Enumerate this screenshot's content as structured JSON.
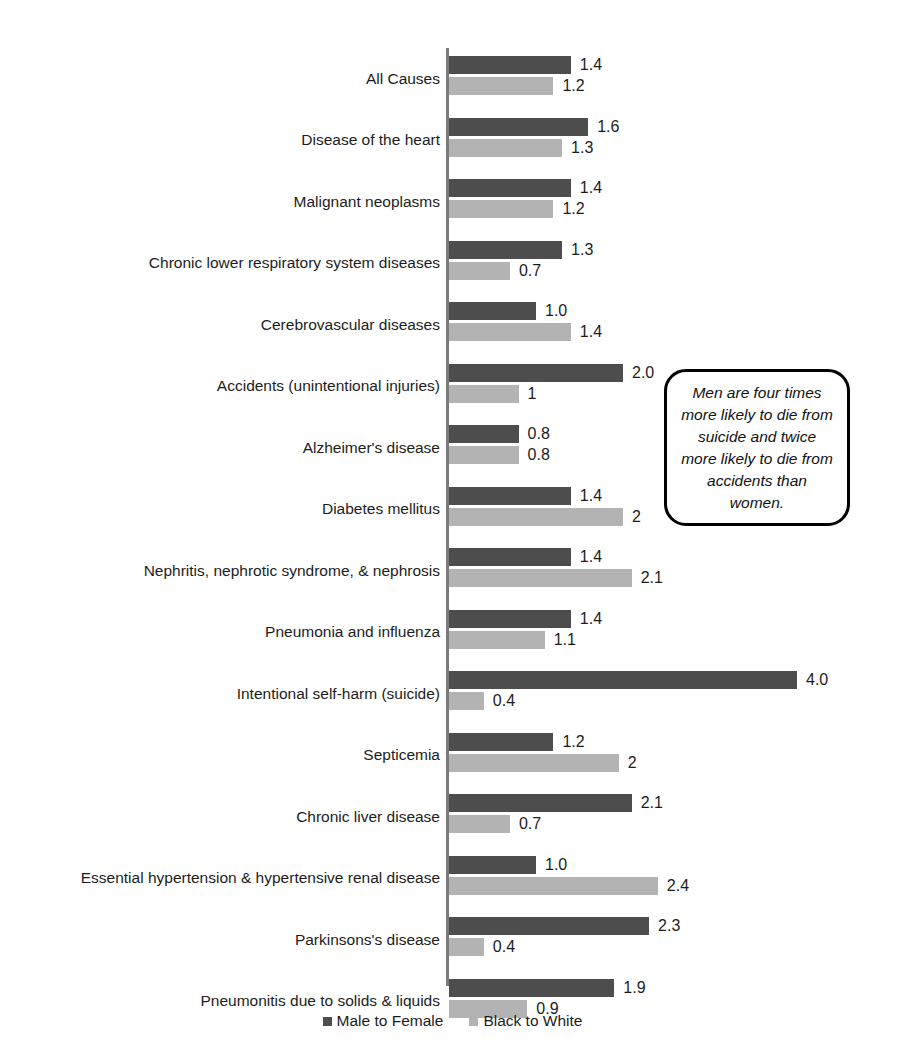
{
  "chart_data": {
    "type": "bar",
    "orientation": "horizontal",
    "title": "",
    "xlabel": "",
    "ylabel": "",
    "xlim": [
      0,
      4.3
    ],
    "grid": false,
    "legend_position": "bottom-center",
    "categories": [
      "All Causes",
      "Disease of the heart",
      "Malignant neoplasms",
      "Chronic lower respiratory system diseases",
      "Cerebrovascular diseases",
      "Accidents (unintentional injuries)",
      "Alzheimer's disease",
      "Diabetes mellitus",
      "Nephritis, nephrotic syndrome, & nephrosis",
      "Pneumonia and influenza",
      "Intentional self-harm (suicide)",
      "Septicemia",
      "Chronic liver disease",
      "Essential hypertension & hypertensive renal disease",
      "Parkinsons's disease",
      "Pneumonitis due to solids & liquids"
    ],
    "series": [
      {
        "name": "Male to Female",
        "color": "#4d4d4d",
        "values": [
          1.4,
          1.6,
          1.4,
          1.3,
          1.0,
          2.0,
          0.8,
          1.4,
          1.4,
          1.4,
          4.0,
          1.2,
          2.1,
          1.0,
          2.3,
          1.9
        ],
        "labels": [
          "1.4",
          "1.6",
          "1.4",
          "1.3",
          "1.0",
          "2.0",
          "0.8",
          "1.4",
          "1.4",
          "1.4",
          "4.0",
          "1.2",
          "2.1",
          "1.0",
          "2.3",
          "1.9"
        ]
      },
      {
        "name": "Black to White",
        "color": "#b3b3b3",
        "values": [
          1.2,
          1.3,
          1.2,
          0.7,
          1.4,
          0.8,
          0.8,
          2.0,
          2.1,
          1.1,
          0.4,
          1.95,
          0.7,
          2.4,
          0.4,
          0.9
        ],
        "labels": [
          "1.2",
          "1.3",
          "1.2",
          "0.7",
          "1.4",
          "1",
          "0.8",
          "2",
          "2.1",
          "1.1",
          "0.4",
          "2",
          "0.7",
          "2.4",
          "0.4",
          "0.9"
        ]
      }
    ],
    "annotations": [
      {
        "name": "callout",
        "text": "Men are four times more likely to die from suicide and twice more likely to die from accidents than women."
      }
    ]
  },
  "legend": {
    "items": [
      {
        "label": "Male to Female",
        "color": "#4d4d4d"
      },
      {
        "label": "Black to White",
        "color": "#b3b3b3"
      }
    ]
  }
}
